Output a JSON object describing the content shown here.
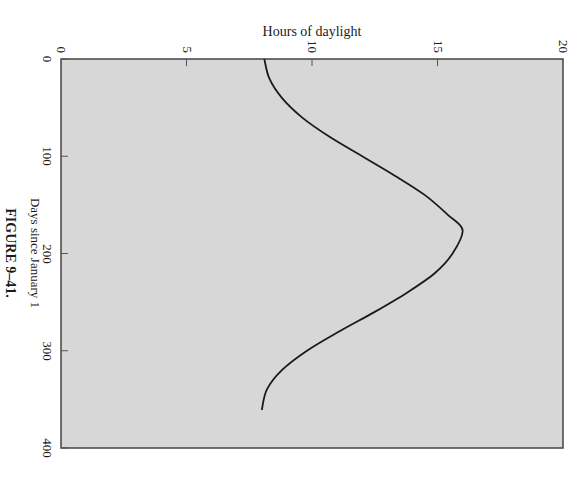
{
  "figure_caption": "FIGURE 9–41.",
  "chart_data": {
    "type": "line",
    "title": "",
    "orientation": "rotated 90° clockwise (days run top-to-bottom, hours run left-to-right)",
    "xlabel": "Days since January 1",
    "ylabel": "Hours of daylight",
    "xlim": [
      0,
      400
    ],
    "ylim": [
      0,
      20
    ],
    "xticks": [
      0,
      100,
      200,
      300,
      400
    ],
    "yticks": [
      0,
      5,
      10,
      15,
      20
    ],
    "grid": false,
    "legend": null,
    "colors": {
      "plot_background": "#d7d7d7",
      "line": "#1a1a1a",
      "frame": "#444444"
    },
    "series": [
      {
        "name": "Hours of daylight",
        "x": [
          0,
          20,
          40,
          60,
          80,
          100,
          120,
          140,
          160,
          176,
          200,
          220,
          240,
          260,
          280,
          300,
          320,
          340,
          361
        ],
        "values": [
          8.1,
          8.3,
          8.8,
          9.6,
          10.7,
          12.0,
          13.3,
          14.5,
          15.4,
          16.0,
          15.6,
          14.9,
          13.8,
          12.5,
          11.1,
          9.8,
          8.8,
          8.2,
          8.0
        ]
      }
    ]
  }
}
